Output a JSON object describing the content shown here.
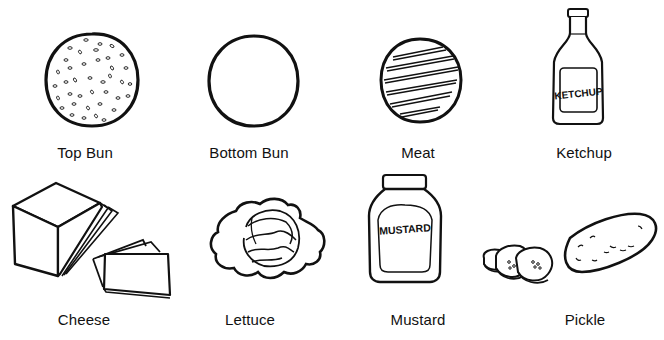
{
  "items": [
    {
      "id": "top-bun",
      "label": "Top Bun",
      "icon": "top-bun-icon"
    },
    {
      "id": "bottom-bun",
      "label": "Bottom Bun",
      "icon": "bottom-bun-icon"
    },
    {
      "id": "meat",
      "label": "Meat",
      "icon": "meat-patty-icon"
    },
    {
      "id": "ketchup",
      "label": "Ketchup",
      "icon": "ketchup-bottle-icon",
      "bottle_text": "KETCHUP"
    },
    {
      "id": "cheese",
      "label": "Cheese",
      "icon": "cheese-icon"
    },
    {
      "id": "lettuce",
      "label": "Lettuce",
      "icon": "lettuce-icon"
    },
    {
      "id": "mustard",
      "label": "Mustard",
      "icon": "mustard-jar-icon",
      "jar_text": "MUSTARD"
    },
    {
      "id": "pickle",
      "label": "Pickle",
      "icon": "pickle-icon"
    }
  ],
  "colors": {
    "ink": "#111111",
    "background": "#ffffff"
  }
}
